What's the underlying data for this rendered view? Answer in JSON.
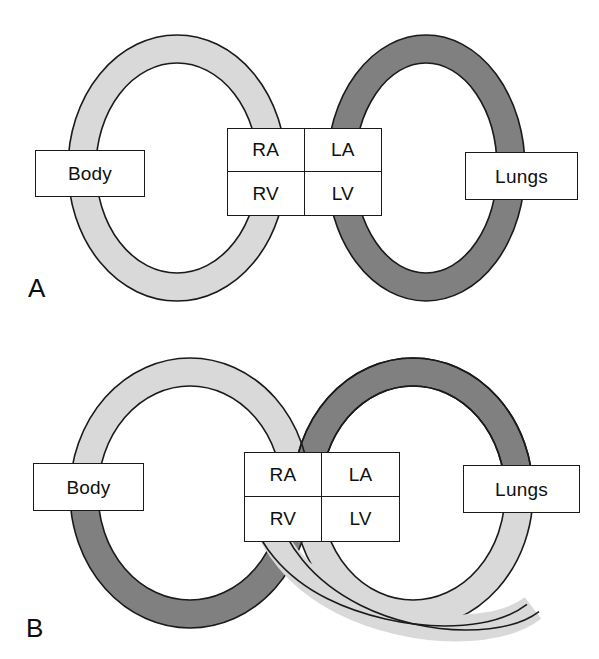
{
  "figure": {
    "background_color": "#ffffff",
    "stroke_color": "#1a1a1a",
    "colors": {
      "deoxygenated_light": "#d9d9d9",
      "oxygenated_dark": "#808080",
      "outline": "#1a1a1a",
      "text": "#101010",
      "page": "#ffffff"
    }
  },
  "panels": [
    {
      "id": "A",
      "letter": "A",
      "description": "Normal circulation: separate systemic and pulmonary loops in series",
      "loops": [
        {
          "name": "systemic-loop",
          "side": "left",
          "organ_label": "Body",
          "top_half_color": "#d9d9d9",
          "bottom_half_color": "#d9d9d9",
          "crossed": false
        },
        {
          "name": "pulmonary-loop",
          "side": "right",
          "organ_label": "Lungs",
          "top_half_color": "#808080",
          "bottom_half_color": "#808080",
          "crossed": false
        }
      ],
      "organ_boxes": [
        {
          "name": "body-box",
          "label": "Body"
        },
        {
          "name": "lungs-box",
          "label": "Lungs"
        }
      ],
      "chambers": [
        {
          "name": "right-atrium",
          "label": "RA"
        },
        {
          "name": "left-atrium",
          "label": "LA"
        },
        {
          "name": "right-ventricle",
          "label": "RV"
        },
        {
          "name": "left-ventricle",
          "label": "LV"
        }
      ]
    },
    {
      "id": "B",
      "letter": "B",
      "description": "Transposition: loops cross below the ventricles, so each loop changes shade at the crossing",
      "loops": [
        {
          "name": "systemic-loop",
          "side": "left",
          "organ_label": "Body",
          "top_half_color": "#d9d9d9",
          "bottom_half_color": "#808080",
          "crossed": true
        },
        {
          "name": "pulmonary-loop",
          "side": "right",
          "organ_label": "Lungs",
          "top_half_color": "#808080",
          "bottom_half_color": "#d9d9d9",
          "crossed": true
        }
      ],
      "organ_boxes": [
        {
          "name": "body-box",
          "label": "Body"
        },
        {
          "name": "lungs-box",
          "label": "Lungs"
        }
      ],
      "chambers": [
        {
          "name": "right-atrium",
          "label": "RA"
        },
        {
          "name": "left-atrium",
          "label": "LA"
        },
        {
          "name": "right-ventricle",
          "label": "RV"
        },
        {
          "name": "left-ventricle",
          "label": "LV"
        }
      ]
    }
  ]
}
